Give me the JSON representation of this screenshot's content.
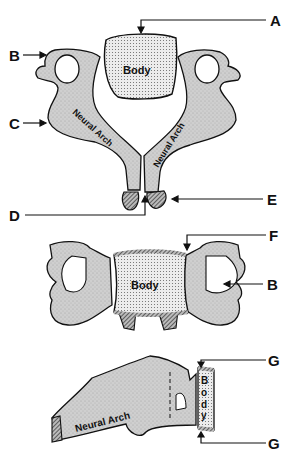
{
  "diagram": {
    "views": [
      {
        "name": "superior-view",
        "body_label": "Body",
        "arch_labels": [
          "Neural Arch",
          "Neural Arch"
        ]
      },
      {
        "name": "anterior-view",
        "body_label": "Body"
      },
      {
        "name": "lateral-view",
        "body_label": "Body",
        "arch_label": "Neural Arch"
      }
    ],
    "callouts": {
      "A": "A",
      "B_top": "B",
      "C": "C",
      "D": "D",
      "E": "E",
      "F": "F",
      "B_mid": "B",
      "G_top": "G",
      "G_bottom": "G"
    },
    "colors": {
      "bone": "#c8c8c8",
      "body_fill": "#e6e6e6",
      "outline": "#111111",
      "hatch": "#555555"
    }
  }
}
